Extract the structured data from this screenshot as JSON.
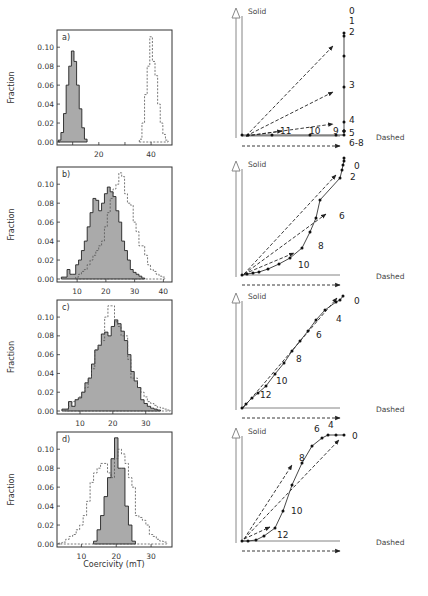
{
  "figure": {
    "x_axis_title": "Coercivity (mT)",
    "y_axis_title": "Fraction",
    "solid_label": "Solid",
    "dashed_label": "Dashed",
    "colors": {
      "fill": "#aaaaaa",
      "stroke": "#222222",
      "dashed": "#555555",
      "axis_arrow": "#888888"
    }
  },
  "chart_data": [
    {
      "panel": "a)",
      "type": "bar",
      "subtype": "histogram-overlay",
      "xlabel": "",
      "ylabel": "Fraction",
      "xlim": [
        4,
        48
      ],
      "ylim": [
        0,
        0.115
      ],
      "xticks": [
        20,
        40
      ],
      "yticks": [
        0.0,
        0.02,
        0.04,
        0.06,
        0.08,
        0.1
      ],
      "ytick_labels": [
        "0.00",
        "0.02",
        "0.04",
        "0.06",
        "0.08",
        "0.10"
      ],
      "series": [
        {
          "name": "Solid",
          "style": "filled",
          "bin_width": 1,
          "x": [
            5,
            6,
            7,
            8,
            9,
            10,
            11,
            12,
            13,
            14,
            15
          ],
          "values": [
            0.002,
            0.01,
            0.03,
            0.06,
            0.08,
            0.096,
            0.085,
            0.06,
            0.035,
            0.015,
            0.003
          ]
        },
        {
          "name": "Dashed",
          "style": "dashed",
          "bin_width": 1,
          "x": [
            36,
            37,
            38,
            39,
            40,
            41,
            42,
            43,
            44,
            45,
            46
          ],
          "values": [
            0.003,
            0.02,
            0.05,
            0.08,
            0.111,
            0.085,
            0.07,
            0.04,
            0.02,
            0.008,
            0.002
          ]
        }
      ]
    },
    {
      "panel": "b)",
      "type": "bar",
      "subtype": "histogram-overlay",
      "xlabel": "",
      "ylabel": "Fraction",
      "xlim": [
        3,
        43
      ],
      "ylim": [
        0,
        0.115
      ],
      "xticks": [
        10,
        20,
        30,
        40
      ],
      "yticks": [
        0.0,
        0.02,
        0.04,
        0.06,
        0.08,
        0.1
      ],
      "ytick_labels": [
        "0.00",
        "0.02",
        "0.04",
        "0.06",
        "0.08",
        "0.10"
      ],
      "series": [
        {
          "name": "Solid",
          "style": "filled",
          "bin_width": 1,
          "x": [
            5,
            6,
            7,
            8,
            9,
            10,
            11,
            12,
            13,
            14,
            15,
            16,
            17,
            18,
            19,
            20,
            21,
            22,
            23,
            24,
            25,
            26,
            27,
            28,
            29,
            30,
            31,
            32,
            33
          ],
          "values": [
            0.002,
            0.002,
            0.01,
            0.005,
            0.005,
            0.015,
            0.02,
            0.03,
            0.04,
            0.055,
            0.07,
            0.085,
            0.083,
            0.072,
            0.08,
            0.09,
            0.097,
            0.092,
            0.087,
            0.072,
            0.06,
            0.04,
            0.03,
            0.02,
            0.01,
            0.007,
            0.005,
            0.003,
            0.001
          ]
        },
        {
          "name": "Dashed",
          "style": "dashed",
          "bin_width": 1,
          "x": [
            10,
            11,
            12,
            13,
            14,
            15,
            16,
            17,
            18,
            19,
            20,
            21,
            22,
            23,
            24,
            25,
            26,
            27,
            28,
            29,
            30,
            31,
            32,
            33,
            34,
            35,
            36,
            37,
            38,
            39,
            40
          ],
          "values": [
            0.002,
            0.005,
            0.008,
            0.01,
            0.015,
            0.02,
            0.025,
            0.03,
            0.035,
            0.04,
            0.055,
            0.07,
            0.085,
            0.095,
            0.1,
            0.112,
            0.108,
            0.09,
            0.08,
            0.078,
            0.06,
            0.05,
            0.035,
            0.035,
            0.025,
            0.015,
            0.01,
            0.008,
            0.005,
            0.003,
            0.002
          ]
        }
      ]
    },
    {
      "panel": "c)",
      "type": "bar",
      "subtype": "histogram-overlay",
      "xlabel": "",
      "ylabel": "Fraction",
      "xlim": [
        3,
        38
      ],
      "ylim": [
        0,
        0.115
      ],
      "xticks": [
        10,
        20,
        30
      ],
      "yticks": [
        0.0,
        0.02,
        0.04,
        0.06,
        0.08,
        0.1
      ],
      "ytick_labels": [
        "0.00",
        "0.02",
        "0.04",
        "0.06",
        "0.08",
        "0.10"
      ],
      "series": [
        {
          "name": "Solid",
          "style": "filled",
          "bin_width": 1,
          "x": [
            5,
            6,
            7,
            8,
            9,
            10,
            11,
            12,
            13,
            14,
            15,
            16,
            17,
            18,
            19,
            20,
            21,
            22,
            23,
            24,
            25,
            26,
            27,
            28,
            29,
            30,
            31,
            32,
            33,
            34
          ],
          "values": [
            0.002,
            0.002,
            0.01,
            0.005,
            0.012,
            0.014,
            0.02,
            0.03,
            0.035,
            0.05,
            0.065,
            0.07,
            0.082,
            0.084,
            0.08,
            0.09,
            0.097,
            0.093,
            0.085,
            0.075,
            0.06,
            0.042,
            0.032,
            0.025,
            0.012,
            0.008,
            0.005,
            0.003,
            0.002,
            0.001
          ]
        },
        {
          "name": "Dashed",
          "style": "dashed",
          "bin_width": 1,
          "x": [
            6,
            7,
            8,
            9,
            10,
            11,
            12,
            13,
            14,
            15,
            16,
            17,
            18,
            19,
            20,
            21,
            22,
            23,
            24,
            25,
            26,
            27,
            28,
            29,
            30,
            31,
            32,
            33,
            34,
            35,
            36,
            37
          ],
          "values": [
            0.002,
            0.005,
            0.01,
            0.012,
            0.015,
            0.02,
            0.025,
            0.035,
            0.045,
            0.065,
            0.07,
            0.075,
            0.1,
            0.112,
            0.112,
            0.095,
            0.09,
            0.08,
            0.08,
            0.055,
            0.035,
            0.035,
            0.025,
            0.02,
            0.015,
            0.01,
            0.008,
            0.006,
            0.004,
            0.003,
            0.002,
            0.001
          ]
        }
      ]
    },
    {
      "panel": "d)",
      "type": "bar",
      "subtype": "histogram-overlay",
      "xlabel": "Coercivity (mT)",
      "ylabel": "Fraction",
      "xlim": [
        3,
        36
      ],
      "ylim": [
        0,
        0.115
      ],
      "xticks": [
        10,
        20,
        30
      ],
      "yticks": [
        0.0,
        0.02,
        0.04,
        0.06,
        0.08,
        0.1
      ],
      "ytick_labels": [
        "0.00",
        "0.02",
        "0.04",
        "0.06",
        "0.08",
        "0.10"
      ],
      "series": [
        {
          "name": "Solid",
          "style": "filled",
          "bin_width": 1,
          "x": [
            14,
            15,
            16,
            17,
            18,
            19,
            20,
            21,
            22,
            23,
            24,
            25
          ],
          "values": [
            0.003,
            0.015,
            0.03,
            0.05,
            0.07,
            0.09,
            0.112,
            0.08,
            0.08,
            0.04,
            0.02,
            0.003
          ]
        },
        {
          "name": "Dashed",
          "style": "dashed",
          "bin_width": 1,
          "x": [
            4,
            5,
            6,
            7,
            8,
            9,
            10,
            11,
            12,
            13,
            14,
            15,
            16,
            17,
            18,
            19,
            20,
            21,
            22,
            23,
            24,
            25,
            26,
            27,
            28,
            29,
            30,
            31,
            32,
            33,
            34
          ],
          "values": [
            0.001,
            0.002,
            0.005,
            0.008,
            0.01,
            0.015,
            0.02,
            0.03,
            0.045,
            0.065,
            0.075,
            0.08,
            0.085,
            0.085,
            0.075,
            0.07,
            0.09,
            0.1,
            0.095,
            0.085,
            0.07,
            0.06,
            0.03,
            0.028,
            0.025,
            0.02,
            0.01,
            0.008,
            0.005,
            0.003,
            0.002
          ]
        }
      ]
    },
    {
      "panel": "a-diagram",
      "type": "line",
      "subtype": "vector-endpoint-diagram",
      "xlabel": "Dashed",
      "ylabel": "Solid",
      "points_px": [
        [
          242,
          135
        ],
        [
          248,
          135
        ],
        [
          272,
          135
        ],
        [
          310,
          135
        ],
        [
          336,
          135
        ],
        [
          344,
          135
        ],
        [
          344,
          131
        ],
        [
          344,
          131
        ],
        [
          344,
          131
        ],
        [
          344,
          122
        ],
        [
          344,
          87
        ],
        [
          344,
          56
        ],
        [
          344,
          36
        ],
        [
          344,
          33
        ]
      ],
      "step_labels": [
        {
          "text": "0",
          "x": 349,
          "y": 14
        },
        {
          "text": "1",
          "x": 349,
          "y": 24
        },
        {
          "text": "2",
          "x": 349,
          "y": 35
        },
        {
          "text": "3",
          "x": 349,
          "y": 88
        },
        {
          "text": "4",
          "x": 349,
          "y": 123
        },
        {
          "text": "5",
          "x": 349,
          "y": 136
        },
        {
          "text": "6-8",
          "x": 349,
          "y": 146
        },
        {
          "text": "9",
          "x": 333,
          "y": 134
        },
        {
          "text": "10",
          "x": 309,
          "y": 134
        },
        {
          "text": "11",
          "x": 280,
          "y": 134
        }
      ],
      "vectors_px": [
        [
          [
            246,
            136
          ],
          [
            333,
            46
          ]
        ],
        [
          [
            246,
            136
          ],
          [
            333,
            92
          ]
        ],
        [
          [
            246,
            136
          ],
          [
            333,
            124
          ]
        ],
        [
          [
            246,
            136
          ],
          [
            282,
            131
          ]
        ]
      ]
    },
    {
      "panel": "b-diagram",
      "type": "line",
      "subtype": "vector-endpoint-diagram",
      "xlabel": "Dashed",
      "ylabel": "Solid",
      "points_px": [
        [
          242,
          275
        ],
        [
          247,
          274
        ],
        [
          253,
          273
        ],
        [
          259,
          272
        ],
        [
          268,
          269
        ],
        [
          279,
          264
        ],
        [
          290,
          258
        ],
        [
          302,
          248
        ],
        [
          310,
          232
        ],
        [
          316,
          218
        ],
        [
          320,
          200
        ],
        [
          340,
          178
        ],
        [
          342,
          170
        ],
        [
          343,
          165
        ],
        [
          344,
          161
        ],
        [
          344,
          158
        ]
      ],
      "step_labels": [
        {
          "text": "0",
          "x": 354,
          "y": 169
        },
        {
          "text": "2",
          "x": 350,
          "y": 180
        },
        {
          "text": "6",
          "x": 339,
          "y": 219
        },
        {
          "text": "8",
          "x": 318,
          "y": 249
        },
        {
          "text": "10",
          "x": 298,
          "y": 268
        }
      ],
      "vectors_px": [
        [
          [
            244,
            274
          ],
          [
            336,
            175
          ]
        ],
        [
          [
            244,
            274
          ],
          [
            326,
            214
          ]
        ],
        [
          [
            244,
            274
          ],
          [
            294,
            253
          ]
        ]
      ]
    },
    {
      "panel": "c-diagram",
      "type": "line",
      "subtype": "vector-endpoint-diagram",
      "xlabel": "Dashed",
      "ylabel": "Solid",
      "points_px": [
        [
          242,
          408
        ],
        [
          246,
          404
        ],
        [
          252,
          398
        ],
        [
          258,
          393
        ],
        [
          266,
          386
        ],
        [
          275,
          374
        ],
        [
          284,
          363
        ],
        [
          292,
          351
        ],
        [
          300,
          341
        ],
        [
          308,
          331
        ],
        [
          316,
          320
        ],
        [
          325,
          310
        ],
        [
          336,
          302
        ],
        [
          340,
          300
        ],
        [
          343,
          296
        ]
      ],
      "step_labels": [
        {
          "text": "0",
          "x": 354,
          "y": 304
        },
        {
          "text": "4",
          "x": 336,
          "y": 322
        },
        {
          "text": "6",
          "x": 316,
          "y": 338
        },
        {
          "text": "8",
          "x": 296,
          "y": 362
        },
        {
          "text": "10",
          "x": 276,
          "y": 384
        },
        {
          "text": "12",
          "x": 260,
          "y": 398
        }
      ],
      "vectors_px": [
        [
          [
            243,
            408
          ],
          [
            337,
            298
          ]
        ]
      ]
    },
    {
      "panel": "d-diagram",
      "type": "line",
      "subtype": "vector-endpoint-diagram",
      "xlabel": "Dashed",
      "ylabel": "Solid",
      "points_px": [
        [
          242,
          541
        ],
        [
          248,
          541
        ],
        [
          256,
          540
        ],
        [
          264,
          536
        ],
        [
          275,
          528
        ],
        [
          283,
          511
        ],
        [
          292,
          485
        ],
        [
          302,
          463
        ],
        [
          312,
          446
        ],
        [
          322,
          438
        ],
        [
          328,
          435
        ],
        [
          336,
          435
        ],
        [
          344,
          435
        ]
      ],
      "step_labels": [
        {
          "text": "0",
          "x": 352,
          "y": 439
        },
        {
          "text": "4",
          "x": 328,
          "y": 428
        },
        {
          "text": "6",
          "x": 314,
          "y": 432
        },
        {
          "text": "8",
          "x": 299,
          "y": 461
        },
        {
          "text": "10",
          "x": 291,
          "y": 514
        },
        {
          "text": "12",
          "x": 277,
          "y": 538
        }
      ],
      "vectors_px": [
        [
          [
            244,
            539
          ],
          [
            339,
            440
          ]
        ],
        [
          [
            244,
            539
          ],
          [
            292,
            465
          ]
        ],
        [
          [
            244,
            539
          ],
          [
            270,
            527
          ]
        ]
      ]
    }
  ]
}
